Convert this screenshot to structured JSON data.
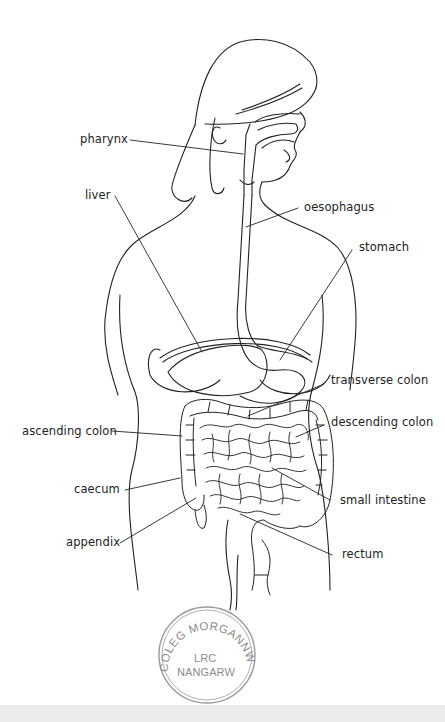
{
  "diagram": {
    "labels": {
      "pharynx": "pharynx",
      "liver": "liver",
      "oesophagus": "oesophagus",
      "stomach": "stomach",
      "transverse_colon": "transverse colon",
      "ascending_colon": "ascending colon",
      "descending_colon": "descending colon",
      "caecum": "caecum",
      "small_intestine": "small intestine",
      "appendix": "appendix",
      "rectum": "rectum"
    }
  },
  "stamp": {
    "ring_text": "COLEG MORGANNWG",
    "line1": "LRC",
    "line2": "NANGARW"
  },
  "colors": {
    "ink": "#222222",
    "stamp": "#9a9a9a",
    "background": "#ffffff"
  }
}
